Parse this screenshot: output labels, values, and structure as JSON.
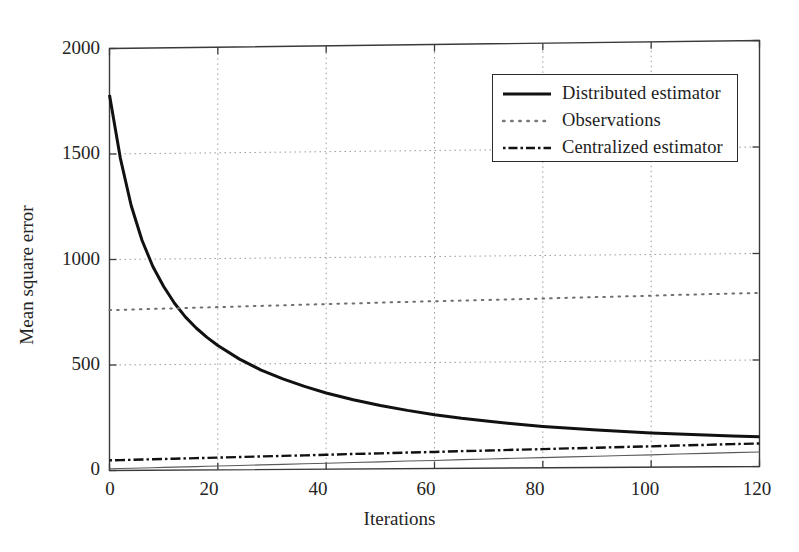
{
  "figure": {
    "background": "#ffffff",
    "frame_color": "#3a3a3a",
    "grid_color": "#9a9a9a",
    "text_color": "#242424"
  },
  "chart_data": {
    "type": "line",
    "title": "",
    "xlabel": "Iterations",
    "ylabel": "Mean square error",
    "xlim": [
      0,
      120
    ],
    "ylim": [
      0,
      2000
    ],
    "xticks": [
      0,
      20,
      40,
      60,
      80,
      100,
      120
    ],
    "yticks": [
      0,
      500,
      1000,
      1500,
      2000
    ],
    "grid": true,
    "legend_position": "upper right",
    "x": [
      0,
      2,
      4,
      6,
      8,
      10,
      12,
      14,
      16,
      18,
      20,
      24,
      28,
      32,
      36,
      40,
      45,
      50,
      55,
      60,
      65,
      70,
      75,
      80,
      85,
      90,
      95,
      100,
      105,
      110,
      115,
      120
    ],
    "series": [
      {
        "name": "Distributed estimator",
        "style": "solid",
        "color": "#111111",
        "width": 3.0,
        "values": [
          1780,
          1480,
          1255,
          1090,
          965,
          870,
          790,
          725,
          672,
          627,
          588,
          523,
          470,
          428,
          392,
          360,
          327,
          299,
          275,
          254,
          236,
          221,
          207,
          195,
          185,
          176,
          168,
          161,
          155,
          149,
          144,
          140
        ]
      },
      {
        "name": "Observations",
        "style": "dotted",
        "color": "#6f6f6f",
        "width": 2.0,
        "values": [
          760,
          761,
          762,
          763,
          764,
          765,
          766,
          767,
          768,
          769,
          770,
          772,
          774,
          776,
          778,
          780,
          782,
          785,
          787,
          789,
          791,
          793,
          795,
          797,
          800,
          802,
          804,
          806,
          809,
          811,
          813,
          815
        ]
      },
      {
        "name": "Centralized estimator",
        "style": "dashdot",
        "color": "#111111",
        "width": 2.4,
        "values": [
          48,
          49,
          50,
          51,
          52,
          53,
          54,
          55,
          56,
          57,
          58,
          60,
          62,
          64,
          66,
          68,
          71,
          73,
          76,
          78,
          81,
          83,
          86,
          88,
          91,
          93,
          96,
          98,
          101,
          103,
          106,
          108
        ]
      }
    ],
    "baseline": {
      "name": "axis-baseline-curve",
      "values": [
        8,
        9,
        10,
        11,
        12,
        13,
        14,
        15,
        16,
        17,
        18,
        20,
        22,
        24,
        26,
        28,
        31,
        33,
        36,
        38,
        41,
        43,
        46,
        48,
        51,
        53,
        56,
        58,
        61,
        63,
        66,
        68
      ]
    }
  },
  "legend": {
    "items": [
      {
        "label": "Distributed estimator",
        "style": "solid"
      },
      {
        "label": "Observations",
        "style": "dotted"
      },
      {
        "label": "Centralized estimator",
        "style": "dashdot"
      }
    ]
  },
  "axes": {
    "y_tick_labels": [
      "2000",
      "1500",
      "1000",
      "500",
      "0"
    ],
    "x_tick_labels": [
      "0",
      "20",
      "40",
      "60",
      "80",
      "100",
      "120"
    ]
  }
}
